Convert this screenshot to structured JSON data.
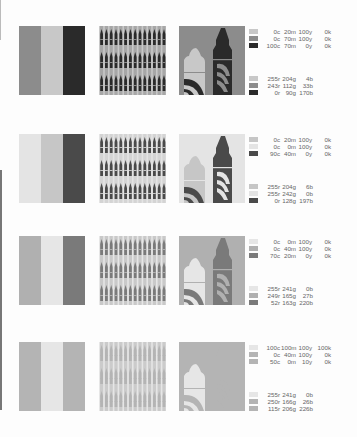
{
  "page": {
    "background": "#fdfdfd"
  },
  "rows": [
    {
      "stripes": [
        "#8c8c8c",
        "#c8c8c8",
        "#2a2a2a"
      ],
      "pattern": {
        "bg": "#c8c8c8",
        "bar": "#2a2a2a",
        "mid": "#8c8c8c"
      },
      "crayon": {
        "bg": "#8c8c8c",
        "left_tip": "#c8c8c8",
        "left_body": "#c8c8c8",
        "left_band": "#2a2a2a",
        "right_tip": "#2a2a2a",
        "right_body": "#2a2a2a",
        "right_band": "#8c8c8c"
      },
      "cmyk": [
        {
          "swatch": "#c8c8c8",
          "c": "0c",
          "m": "20m",
          "y": "100y",
          "k": "0k"
        },
        {
          "swatch": "#8c8c8c",
          "c": "0c",
          "m": "70m",
          "y": "100y",
          "k": "0k"
        },
        {
          "swatch": "#2a2a2a",
          "c": "100c",
          "m": "70m",
          "y": "0y",
          "k": "0k"
        }
      ],
      "rgb": [
        {
          "swatch": "#c8c8c8",
          "r": "255r",
          "g": "204g",
          "b": "4b"
        },
        {
          "swatch": "#8c8c8c",
          "r": "243r",
          "g": "112g",
          "b": "33b"
        },
        {
          "swatch": "#2a2a2a",
          "r": "0r",
          "g": "90g",
          "b": "170b"
        }
      ]
    },
    {
      "stripes": [
        "#e4e4e4",
        "#c6c6c6",
        "#4a4a4a"
      ],
      "pattern": {
        "bg": "#e4e4e4",
        "bar": "#4a4a4a",
        "mid": "#c6c6c6"
      },
      "crayon": {
        "bg": "#e4e4e4",
        "left_tip": "#c6c6c6",
        "left_body": "#c6c6c6",
        "left_band": "#4a4a4a",
        "right_tip": "#4a4a4a",
        "right_body": "#4a4a4a",
        "right_band": "#e4e4e4"
      },
      "cmyk": [
        {
          "swatch": "#c6c6c6",
          "c": "0c",
          "m": "20m",
          "y": "100y",
          "k": "0k"
        },
        {
          "swatch": "#e4e4e4",
          "c": "0c",
          "m": "0m",
          "y": "100y",
          "k": "0k"
        },
        {
          "swatch": "#4a4a4a",
          "c": "90c",
          "m": "40m",
          "y": "0y",
          "k": "0k"
        }
      ],
      "rgb": [
        {
          "swatch": "#c6c6c6",
          "r": "255r",
          "g": "204g",
          "b": "6b"
        },
        {
          "swatch": "#e4e4e4",
          "r": "255r",
          "g": "242g",
          "b": "0b"
        },
        {
          "swatch": "#4a4a4a",
          "r": "0r",
          "g": "128g",
          "b": "197b"
        }
      ]
    },
    {
      "stripes": [
        "#b0b0b0",
        "#e6e6e6",
        "#7a7a7a"
      ],
      "pattern": {
        "bg": "#e6e6e6",
        "bar": "#7a7a7a",
        "mid": "#b0b0b0"
      },
      "crayon": {
        "bg": "#b0b0b0",
        "left_tip": "#e6e6e6",
        "left_body": "#e6e6e6",
        "left_band": "#7a7a7a",
        "right_tip": "#7a7a7a",
        "right_body": "#7a7a7a",
        "right_band": "#b0b0b0"
      },
      "cmyk": [
        {
          "swatch": "#e6e6e6",
          "c": "0c",
          "m": "0m",
          "y": "100y",
          "k": "0k"
        },
        {
          "swatch": "#b0b0b0",
          "c": "0c",
          "m": "40m",
          "y": "100y",
          "k": "0k"
        },
        {
          "swatch": "#7a7a7a",
          "c": "70c",
          "m": "20m",
          "y": "0y",
          "k": "0k"
        }
      ],
      "rgb": [
        {
          "swatch": "#e6e6e6",
          "r": "255r",
          "g": "241g",
          "b": "0b"
        },
        {
          "swatch": "#b0b0b0",
          "r": "249r",
          "g": "165g",
          "b": "27b"
        },
        {
          "swatch": "#7a7a7a",
          "r": "52r",
          "g": "163g",
          "b": "220b"
        }
      ]
    },
    {
      "stripes": [
        "#b4b4b4",
        "#e6e6e6",
        "#b4b4b4"
      ],
      "pattern": {
        "bg": "#e6e6e6",
        "bar": "#b4b4b4",
        "mid": "#b4b4b4"
      },
      "crayon": {
        "bg": "#b4b4b4",
        "left_tip": "#e6e6e6",
        "left_body": "#e6e6e6",
        "left_band": "#b4b4b4",
        "right_tip": "#b4b4b4",
        "right_body": "#b4b4b4",
        "right_band": "#b4b4b4"
      },
      "cmyk": [
        {
          "swatch": "#e6e6e6",
          "c": "100c",
          "m": "100m",
          "y": "100y",
          "k": "100k"
        },
        {
          "swatch": "#b4b4b4",
          "c": "0c",
          "m": "40m",
          "y": "100y",
          "k": "0k"
        },
        {
          "swatch": "#b4b4b4",
          "c": "50c",
          "m": "0m",
          "y": "10y",
          "k": "0k"
        }
      ],
      "rgb": [
        {
          "swatch": "#e6e6e6",
          "r": "255r",
          "g": "241g",
          "b": "0b"
        },
        {
          "swatch": "#b4b4b4",
          "r": "250r",
          "g": "166g",
          "b": "26b"
        },
        {
          "swatch": "#b4b4b4",
          "r": "115r",
          "g": "206g",
          "b": "226b"
        }
      ]
    }
  ],
  "layout": {
    "row_tops": [
      26,
      134,
      236,
      342
    ]
  }
}
